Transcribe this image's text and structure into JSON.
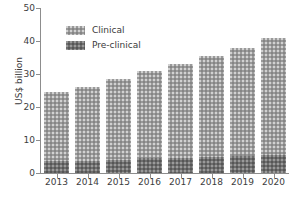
{
  "chart_data": {
    "type": "bar",
    "stacked": true,
    "title": "",
    "xlabel": "",
    "ylabel": "US$ billion",
    "categories": [
      "2013",
      "2014",
      "2015",
      "2016",
      "2017",
      "2018",
      "2019",
      "2020"
    ],
    "series": [
      {
        "name": "Pre-clinical",
        "color": "#6e6e6e",
        "values": [
          3.5,
          3.6,
          4.0,
          4.4,
          4.7,
          4.9,
          5.2,
          5.5
        ]
      },
      {
        "name": "Clinical",
        "color": "#9a9a9a",
        "values": [
          21.0,
          22.4,
          24.5,
          26.6,
          28.3,
          30.6,
          32.8,
          35.5
        ]
      }
    ],
    "totals": [
      24.5,
      26.0,
      28.5,
      31.0,
      33.0,
      35.5,
      38.0,
      41.0
    ],
    "ylim": [
      0,
      50
    ],
    "yticks": [
      0,
      10,
      20,
      30,
      40,
      50
    ],
    "ytick_labels": [
      "0",
      "10",
      "20",
      "30",
      "40",
      "50"
    ],
    "grid": false,
    "legend_position": "upper-left-inside",
    "legend": [
      "Clinical",
      "Pre-clinical"
    ]
  },
  "axis": {
    "y_title": "US$ billion"
  },
  "legend": {
    "items": [
      {
        "label": "Clinical",
        "color": "#9a9a9a"
      },
      {
        "label": "Pre-clinical",
        "color": "#6e6e6e"
      }
    ]
  }
}
